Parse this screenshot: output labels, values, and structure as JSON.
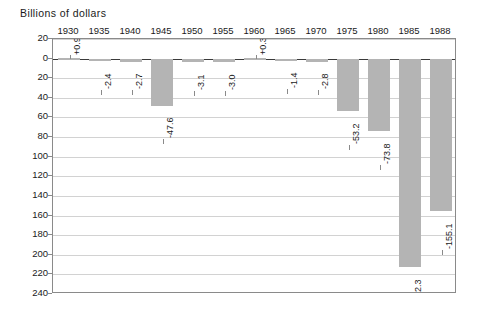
{
  "chart_data": {
    "type": "bar",
    "title": "Billions of dollars",
    "subtitle": "",
    "xlabel": "",
    "ylabel": "Billions of dollars",
    "categories": [
      "1930",
      "1935",
      "1940",
      "1945",
      "1950",
      "1955",
      "1960",
      "1965",
      "1970",
      "1975",
      "1980",
      "1985",
      "1988"
    ],
    "values": [
      0.9,
      -2.4,
      -2.7,
      -47.6,
      -3.1,
      -3.0,
      0.3,
      -1.4,
      -2.8,
      -53.2,
      -73.8,
      -212.3,
      -155.1
    ],
    "value_labels": [
      "+0.9",
      "-2.4",
      "-2.7",
      "-47.6",
      "-3.1",
      "-3.0",
      "+0.3",
      "-1.4",
      "-2.8",
      "-53.2",
      "-73.8",
      "-212.3",
      "-155.1"
    ],
    "ytick_labels": [
      "20",
      "0",
      "20",
      "40",
      "60",
      "80",
      "100",
      "120",
      "140",
      "160",
      "180",
      "200",
      "220",
      "240"
    ],
    "ytick_values": [
      20,
      0,
      -20,
      -40,
      -60,
      -80,
      -100,
      -120,
      -140,
      -160,
      -180,
      -200,
      -220,
      -240
    ],
    "ylim": [
      -240,
      20
    ],
    "y_axis_inverted": true,
    "grid": true,
    "legend": false,
    "legend_position": "none",
    "bar_color": "#b4b4b4",
    "grid_color": "#d2d2d2",
    "axis_color": "#8a8a8a",
    "zero_line_color": "#3a3a3a"
  }
}
